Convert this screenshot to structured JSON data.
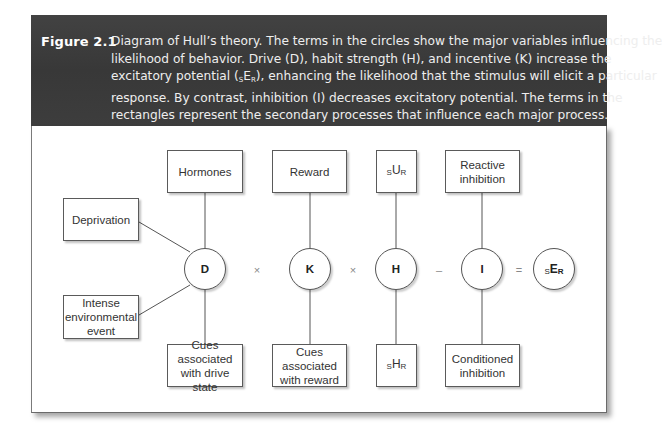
{
  "figure": {
    "label": "Figure 2.1",
    "caption_lines": [
      "Diagram of Hull’s theory. The terms in the circles show the major variables influencing the",
      "likelihood of behavior. Drive (D), habit strength (H), and incentive (K) increase the",
      "excitatory potential (",
      "), enhancing the likelihood that the stimulus will elicit a particular",
      "response. By contrast, inhibition (I) decreases excitatory potential. The terms in the",
      "rectangles represent the secondary processes that influence each major process."
    ],
    "caption_symbol": {
      "pre": "S",
      "main": "E",
      "post": "R"
    }
  },
  "diagram": {
    "circles": {
      "drive": "D",
      "incentive": "K",
      "habit": "H",
      "inhibition": "I",
      "excitatory_potential": {
        "pre": "S",
        "main": "E",
        "post": "R"
      }
    },
    "operators": {
      "times_1": "×",
      "times_2": "×",
      "minus": "–",
      "equals": "="
    },
    "boxes": {
      "hormones": "Hormones",
      "deprivation": "Deprivation",
      "intense_event": [
        "Intense",
        "environmental",
        "event"
      ],
      "cues_drive": [
        "Cues",
        "associated",
        "with drive state"
      ],
      "reward": "Reward",
      "cues_reward": [
        "Cues",
        "associated",
        "with reward"
      ],
      "sur": {
        "pre": "S",
        "main": "U",
        "post": "R"
      },
      "shr": {
        "pre": "S",
        "main": "H",
        "post": "R"
      },
      "reactive_inhibition": [
        "Reactive",
        "inhibition"
      ],
      "conditioned_inhibition": [
        "Conditioned",
        "inhibition"
      ]
    }
  }
}
